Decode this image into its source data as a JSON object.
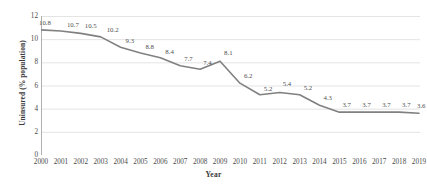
{
  "chart_data": {
    "type": "line",
    "title": "",
    "xlabel": "Year",
    "ylabel": "Uninsured (% population)",
    "categories": [
      "2000",
      "2001",
      "2002",
      "2003",
      "2004",
      "2005",
      "2006",
      "2007",
      "2008",
      "2009",
      "2010",
      "2011",
      "2012",
      "2013",
      "2014",
      "2015",
      "2016",
      "2017",
      "2018",
      "2019"
    ],
    "values": [
      10.8,
      10.7,
      10.5,
      10.2,
      9.3,
      8.8,
      8.4,
      7.7,
      7.4,
      8.1,
      6.2,
      5.2,
      5.4,
      5.2,
      4.3,
      3.7,
      3.7,
      3.7,
      3.7,
      3.6
    ],
    "data_labels": [
      "10.8",
      "10.7",
      "10.5",
      "10.2",
      "9.3",
      "8.8",
      "8.4",
      "7.7",
      "7.4",
      "8.1",
      "6.2",
      "5.2",
      "5.4",
      "5.2",
      "4.3",
      "3.7",
      "3.7",
      "3.7",
      "3.7",
      "3.6"
    ],
    "series": [
      {
        "name": "Uninsured (% population)",
        "values": [
          10.8,
          10.7,
          10.5,
          10.2,
          9.3,
          8.8,
          8.4,
          7.7,
          7.4,
          8.1,
          6.2,
          5.2,
          5.4,
          5.2,
          4.3,
          3.7,
          3.7,
          3.7,
          3.7,
          3.6
        ]
      }
    ],
    "ylim": [
      0,
      12
    ],
    "yticks": [
      "0",
      "2",
      "4",
      "6",
      "8",
      "10",
      "12"
    ],
    "ytick_values": [
      0,
      2,
      4,
      6,
      8,
      10,
      12
    ],
    "grid": true,
    "grid_axis": "y",
    "legend": false,
    "legend_position": "none",
    "line_color": "#808080",
    "grid_color": "#d9d9d9",
    "axis_color": "#a6a6a6",
    "text_color": "#4a4a4a",
    "background": "#ffffff"
  }
}
